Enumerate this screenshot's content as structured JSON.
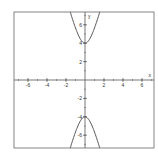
{
  "chart_data": {
    "type": "line",
    "title": "",
    "xlabel": "x",
    "ylabel": "y",
    "xlim": [
      -7.3,
      7.3
    ],
    "ylim": [
      -7.3,
      7.3
    ],
    "grid": false,
    "x_ticks": [
      -6,
      -4,
      -2,
      2,
      4,
      6
    ],
    "y_ticks": [
      -6,
      -4,
      -2,
      2,
      4,
      6
    ],
    "x_tick_labels": [
      "-6",
      "-4",
      "-2",
      "2",
      "4",
      "6"
    ],
    "y_tick_labels": [
      "-6",
      "-4",
      "-2",
      "2",
      "4",
      "6"
    ],
    "equation": "y^2/16 - x^2 = 1",
    "series": [
      {
        "name": "upper branch",
        "vertex": [
          0,
          4
        ],
        "x": [
          -1.5,
          -1,
          -0.5,
          0,
          0.5,
          1,
          1.5
        ],
        "y": [
          7.2,
          5.66,
          4.47,
          4,
          4.47,
          5.66,
          7.2
        ]
      },
      {
        "name": "lower branch",
        "vertex": [
          0,
          -4
        ],
        "x": [
          -1.5,
          -1,
          -0.5,
          0,
          0.5,
          1,
          1.5
        ],
        "y": [
          -7.2,
          -5.66,
          -4.47,
          -4,
          -4.47,
          -5.66,
          -7.2
        ]
      }
    ],
    "colors": {
      "curve": "#555555",
      "axes": "#555555",
      "frame": "#666666"
    }
  }
}
